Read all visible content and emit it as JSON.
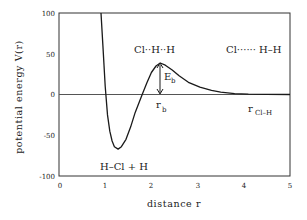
{
  "chart_data": {
    "type": "line",
    "title": "",
    "xlabel": "distance r",
    "ylabel": "potential energy V(r)",
    "xlim": [
      0,
      5
    ],
    "ylim": [
      -100,
      100
    ],
    "x_ticks": [
      "0",
      "1",
      "2",
      "3",
      "4",
      "5"
    ],
    "y_ticks": [
      "100",
      "50",
      "0",
      "-50",
      "-100"
    ],
    "grid": false,
    "legend": null,
    "series": [
      {
        "name": "V(r)",
        "x": [
          0.91,
          0.95,
          1.0,
          1.05,
          1.1,
          1.15,
          1.2,
          1.28,
          1.35,
          1.45,
          1.55,
          1.65,
          1.8,
          1.9,
          2.0,
          2.1,
          2.19,
          2.3,
          2.45,
          2.6,
          2.8,
          3.05,
          3.3,
          3.5,
          3.8,
          4.1,
          4.5,
          5.0
        ],
        "y": [
          100,
          60,
          10,
          -25,
          -45,
          -57,
          -64,
          -67,
          -64,
          -55,
          -40,
          -22,
          0,
          14,
          27,
          35,
          38.6,
          36,
          30,
          23,
          15,
          9,
          5,
          3,
          1,
          0.4,
          0.1,
          0
        ]
      }
    ],
    "reference_line": {
      "y": 0
    },
    "annotations": [
      {
        "text": "Cl··H··H",
        "x": 2.2,
        "y": 52
      },
      {
        "text": "Cl······H–H",
        "x": 4.2,
        "y": 52
      },
      {
        "text": "E_b",
        "x": 2.35,
        "y": 22,
        "note": "double arrow from peak to zero line at r_b"
      },
      {
        "text": "r_b",
        "x": 2.15,
        "y": -12
      },
      {
        "text": "r_Cl–H",
        "x": 4.0,
        "y": -22
      },
      {
        "text": "H–Cl + H",
        "x": 1.5,
        "y": -88
      }
    ],
    "barrier": {
      "r_b": 2.19,
      "E_b": 38.6
    },
    "well": {
      "r": 1.28,
      "V": -67
    }
  },
  "labels": {
    "xlabel": "distance r",
    "ylabel": "potential energy V(r)",
    "x_ticks": [
      "0",
      "1",
      "2",
      "3",
      "4",
      "5"
    ],
    "y_ticks": [
      "100",
      "50",
      "0",
      "-50",
      "-100"
    ],
    "ann_transition": "Cl··H··H",
    "ann_reactants": "Cl······ H–H",
    "ann_products": "H–Cl + H",
    "ann_Eb_main": "E",
    "ann_Eb_sub": "b",
    "ann_rb_main": "r",
    "ann_rb_sub": "b",
    "ann_rclh_main": "r",
    "ann_rclh_sub": "Cl–H"
  },
  "colors": {
    "curve": "#1a1a1a",
    "frame": "#333333",
    "zero_line": "#555555",
    "background": "#ffffff"
  }
}
